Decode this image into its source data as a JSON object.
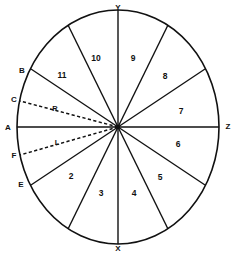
{
  "figure": {
    "shape": "circle",
    "center": {
      "x": 118,
      "y": 127
    },
    "radius_x": 101,
    "radius_y": 117,
    "stroke_color": "#111111",
    "background_color": "#ffffff",
    "line_width": 1.4
  },
  "axes": [
    {
      "name": "vertical-axis",
      "from_label": "Y",
      "to_label": "X",
      "style": "solid"
    },
    {
      "name": "horizontal-axis",
      "from_label": "A",
      "to_label": "Z",
      "style": "solid"
    }
  ],
  "axis_labels": {
    "top": "Y",
    "bottom": "X",
    "left": "A",
    "right": "Z"
  },
  "perimeter_points": [
    {
      "id": "B",
      "label": "B",
      "angle_deg": 157,
      "x": 23,
      "y": 71
    },
    {
      "id": "C",
      "label": "C",
      "angle_deg": 170,
      "x": 15,
      "y": 100
    },
    {
      "id": "A",
      "label": "A",
      "angle_deg": 180,
      "x": 13,
      "y": 128
    },
    {
      "id": "F",
      "label": "F",
      "angle_deg": 192,
      "x": 15,
      "y": 155
    },
    {
      "id": "E",
      "label": "E",
      "angle_deg": 203,
      "x": 22,
      "y": 184
    },
    {
      "id": "Y",
      "label": "Y",
      "angle_deg": 90,
      "x": 118,
      "y": 8
    },
    {
      "id": "Z",
      "label": "Z",
      "angle_deg": 0,
      "x": 224,
      "y": 127
    },
    {
      "id": "X",
      "label": "X",
      "angle_deg": 270,
      "x": 118,
      "y": 247
    }
  ],
  "dashed_rays": [
    {
      "id": "R",
      "label": "R",
      "to_point": "C",
      "label_x": 55,
      "label_y": 109,
      "style": "dashed"
    },
    {
      "id": "L",
      "label": "L",
      "to_point": "F",
      "label_x": 57,
      "label_y": 143,
      "style": "dashed"
    }
  ],
  "sectors": [
    {
      "number": "12",
      "label": "",
      "label_x": 36,
      "label_y": 90,
      "visible": false
    },
    {
      "number": "11",
      "label": "11",
      "label_x": 62,
      "label_y": 76,
      "visible": true
    },
    {
      "number": "10",
      "label": "10",
      "label_x": 96,
      "label_y": 59,
      "visible": true
    },
    {
      "number": "9",
      "label": "9",
      "label_x": 133,
      "label_y": 59,
      "visible": true
    },
    {
      "number": "8",
      "label": "8",
      "label_x": 165,
      "label_y": 77,
      "visible": true
    },
    {
      "number": "7",
      "label": "7",
      "label_x": 181,
      "label_y": 112,
      "visible": true
    },
    {
      "number": "6",
      "label": "6",
      "label_x": 178,
      "label_y": 145,
      "visible": true
    },
    {
      "number": "5",
      "label": "5",
      "label_x": 160,
      "label_y": 178,
      "visible": true
    },
    {
      "number": "4",
      "label": "4",
      "label_x": 134,
      "label_y": 194,
      "visible": true
    },
    {
      "number": "3",
      "label": "3",
      "label_x": 101,
      "label_y": 194,
      "visible": true
    },
    {
      "number": "2",
      "label": "2",
      "label_x": 71,
      "label_y": 177,
      "visible": true
    },
    {
      "number": "1",
      "label": "",
      "label_x": 37,
      "label_y": 163,
      "visible": false
    }
  ],
  "sector_boundary_angles_deg": [
    90,
    120,
    150,
    180,
    210,
    240,
    270,
    300,
    330,
    0,
    30,
    60
  ],
  "visible_sector_labels": [
    "2",
    "3",
    "4",
    "5",
    "6",
    "7",
    "8",
    "9",
    "10",
    "11"
  ],
  "notes": {
    "line_style_solid": "solid",
    "line_style_dashed": "dashed"
  }
}
